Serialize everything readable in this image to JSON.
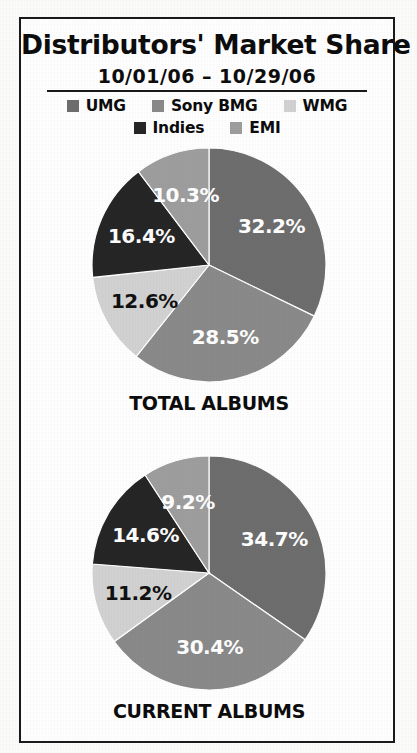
{
  "header": {
    "title": "Distributors' Market Share",
    "subtitle": "10/01/06 – 10/29/06"
  },
  "legend": {
    "rows": [
      [
        {
          "label": "UMG",
          "color": "#6e6e6e",
          "swatch_name": "legend-swatch-umg"
        },
        {
          "label": "Sony BMG",
          "color": "#8a8a8a",
          "swatch_name": "legend-swatch-sony-bmg"
        },
        {
          "label": "WMG",
          "color": "#d2d2d2",
          "swatch_name": "legend-swatch-wmg"
        }
      ],
      [
        {
          "label": "Indies",
          "color": "#262626",
          "swatch_name": "legend-swatch-indies"
        },
        {
          "label": "EMI",
          "color": "#9e9e9e",
          "swatch_name": "legend-swatch-emi"
        }
      ]
    ]
  },
  "chart_data": [
    {
      "type": "pie",
      "title": "TOTAL ALBUMS",
      "categories": [
        "UMG",
        "Sony BMG",
        "WMG",
        "Indies",
        "EMI"
      ],
      "values": [
        32.2,
        28.5,
        12.6,
        16.4,
        10.3
      ],
      "labels": [
        "32.2%",
        "28.5%",
        "12.6%",
        "16.4%",
        "10.3%"
      ],
      "colors": [
        "#6e6e6e",
        "#8a8a8a",
        "#d2d2d2",
        "#262626",
        "#9e9e9e"
      ],
      "label_colors": [
        "#ffffff",
        "#ffffff",
        "#111111",
        "#ffffff",
        "#ffffff"
      ],
      "start_angle": 0,
      "direction": "clockwise",
      "legend_position": "top",
      "grid": false
    },
    {
      "type": "pie",
      "title": "CURRENT ALBUMS",
      "categories": [
        "UMG",
        "Sony BMG",
        "WMG",
        "Indies",
        "EMI"
      ],
      "values": [
        34.7,
        30.4,
        11.2,
        14.6,
        9.2
      ],
      "labels": [
        "34.7%",
        "30.4%",
        "11.2%",
        "14.6%",
        "9.2%"
      ],
      "colors": [
        "#6e6e6e",
        "#8a8a8a",
        "#d2d2d2",
        "#262626",
        "#9e9e9e"
      ],
      "label_colors": [
        "#ffffff",
        "#ffffff",
        "#111111",
        "#ffffff",
        "#ffffff"
      ],
      "start_angle": 0,
      "direction": "clockwise",
      "legend_position": "top",
      "grid": false
    }
  ]
}
